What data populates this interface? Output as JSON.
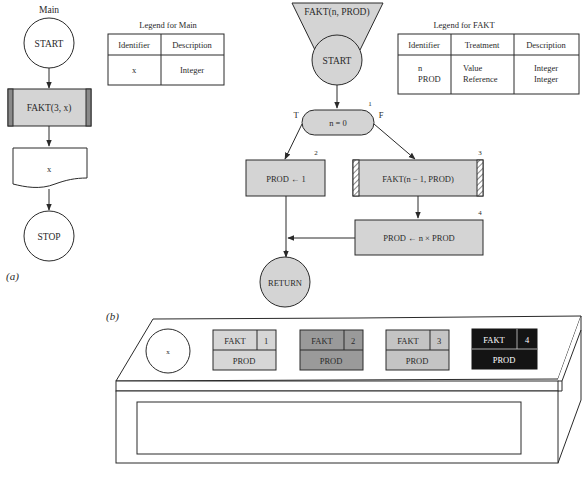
{
  "part_a_label": "(a)",
  "part_b_label": "(b)",
  "main": {
    "title": "Main",
    "start": "START",
    "call": "FAKT(3, x)",
    "output": "x",
    "stop": "STOP"
  },
  "legend_main": {
    "title": "Legend for Main",
    "headers": [
      "Identifier",
      "Description"
    ],
    "rows": [
      [
        "x",
        "Integer"
      ]
    ]
  },
  "fakt": {
    "header": "FAKT(n, PROD)",
    "start": "START",
    "decision": {
      "text": "n = 0",
      "number": "1",
      "true_label": "T",
      "false_label": "F"
    },
    "assign_one": {
      "text": "PROD ← 1",
      "number": "2"
    },
    "recursive_call": {
      "text": "FAKT(n − 1, PROD)",
      "number": "3"
    },
    "multiply": {
      "text": "PROD ← n × PROD",
      "number": "4"
    },
    "return": "RETURN"
  },
  "legend_fakt": {
    "title": "Legend for FAKT",
    "headers": [
      "Identifier",
      "Treatment",
      "Description"
    ],
    "rows": [
      [
        "n",
        "Value",
        "Integer"
      ],
      [
        "PROD",
        "Reference",
        "Integer"
      ]
    ]
  },
  "stack": {
    "variable": "x",
    "frames": [
      {
        "name": "FAKT",
        "level": "1",
        "param": "PROD",
        "fill": "#d6d6d6",
        "text": "#333333"
      },
      {
        "name": "FAKT",
        "level": "2",
        "param": "PROD",
        "fill": "#9a9a9a",
        "text": "#2a2a2a"
      },
      {
        "name": "FAKT",
        "level": "3",
        "param": "PROD",
        "fill": "#c4c4c4",
        "text": "#333333"
      },
      {
        "name": "FAKT",
        "level": "4",
        "param": "PROD",
        "fill": "#141414",
        "text": "#ffffff"
      }
    ]
  },
  "colors": {
    "line": "#2a2a2a",
    "shape_fill": "#d4d4d4",
    "bar_fill": "#8a8a8a"
  }
}
